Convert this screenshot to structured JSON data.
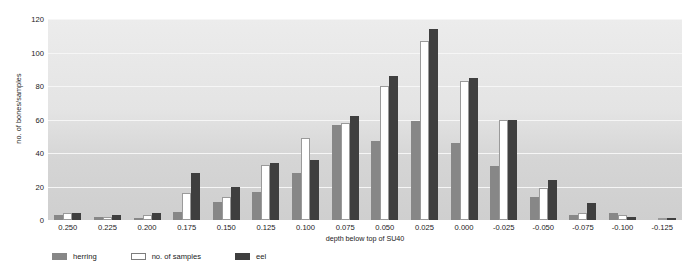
{
  "chart_data": {
    "type": "bar",
    "title": "",
    "xlabel": "depth below top of SU40",
    "ylabel": "no. of bones/samples",
    "categories": [
      "0.250",
      "0.225",
      "0.200",
      "0.175",
      "0.150",
      "0.125",
      "0.100",
      "0.075",
      "0.050",
      "0.025",
      "0.000",
      "-0.025",
      "-0.050",
      "-0.075",
      "-0.100",
      "-0.125"
    ],
    "ylim": [
      0,
      120
    ],
    "yticks": [
      0,
      20,
      40,
      60,
      80,
      100,
      120
    ],
    "grid": true,
    "legend_position": "bottom-left",
    "series": [
      {
        "name": "herring",
        "color": "#878787",
        "values": [
          3,
          2,
          1,
          5,
          11,
          17,
          28,
          57,
          47,
          59,
          46,
          32,
          14,
          3,
          4,
          0
        ]
      },
      {
        "name": "no. of samples",
        "color": "#ffffff",
        "values": [
          4,
          2,
          3,
          16,
          14,
          33,
          49,
          58,
          80,
          107,
          83,
          60,
          19,
          4,
          3,
          1
        ]
      },
      {
        "name": "eel",
        "color": "#3f3f3f",
        "values": [
          4,
          3,
          4,
          28,
          20,
          34,
          36,
          62,
          86,
          114,
          85,
          60,
          24,
          10,
          2,
          1
        ]
      }
    ]
  }
}
